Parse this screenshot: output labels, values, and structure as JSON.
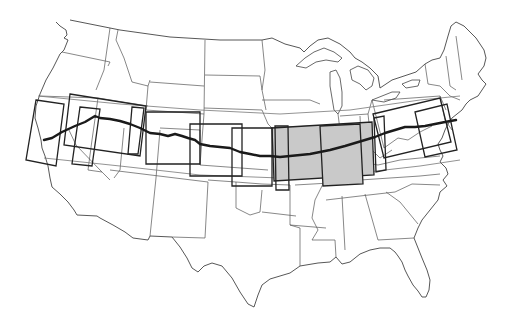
{
  "map": {
    "subject": "Contiguous United States outline map with a cross-country route and overlapping map-sheet index boxes",
    "colors": {
      "background": "#ffffff",
      "state_lines": "#555555",
      "route": "#1a1a1a",
      "box_stroke": "#222222",
      "highlight_fill": "#c9c9c9"
    },
    "route": {
      "label": "Cross-country route (west coast to east coast)",
      "points": [
        [
          44,
          140
        ],
        [
          62,
          132
        ],
        [
          85,
          122
        ],
        [
          100,
          118
        ],
        [
          115,
          120
        ],
        [
          130,
          124
        ],
        [
          140,
          128
        ],
        [
          150,
          133
        ],
        [
          165,
          136
        ],
        [
          180,
          136
        ],
        [
          195,
          140
        ],
        [
          210,
          146
        ],
        [
          225,
          147
        ],
        [
          240,
          152
        ],
        [
          255,
          155
        ],
        [
          270,
          156
        ],
        [
          290,
          156
        ],
        [
          310,
          154
        ],
        [
          330,
          150
        ],
        [
          355,
          143
        ],
        [
          375,
          137
        ],
        [
          395,
          130
        ],
        [
          410,
          127
        ],
        [
          420,
          126
        ],
        [
          430,
          125
        ],
        [
          445,
          120
        ],
        [
          456,
          120
        ]
      ]
    },
    "index_boxes": [
      {
        "id": "box-1",
        "x": 32,
        "y": 100,
        "w": 28,
        "h": 55,
        "rot": 5,
        "highlighted": false
      },
      {
        "id": "box-2",
        "x": 64,
        "y": 98,
        "w": 40,
        "h": 48,
        "rot": 5,
        "highlighted": false
      },
      {
        "id": "box-3",
        "x": 98,
        "y": 95,
        "w": 40,
        "h": 60,
        "rot": 4,
        "highlighted": false
      },
      {
        "id": "box-4",
        "x": 135,
        "y": 106,
        "w": 42,
        "h": 52,
        "rot": 3,
        "highlighted": false
      },
      {
        "id": "box-5",
        "x": 190,
        "y": 122,
        "w": 52,
        "h": 38,
        "rot": 0,
        "highlighted": false
      },
      {
        "id": "box-6",
        "x": 230,
        "y": 127,
        "w": 42,
        "h": 60,
        "rot": 0,
        "highlighted": false
      },
      {
        "id": "box-7",
        "x": 272,
        "y": 124,
        "w": 100,
        "h": 52,
        "rot": -3,
        "highlighted": true
      },
      {
        "id": "box-8",
        "x": 320,
        "y": 122,
        "w": 46,
        "h": 63,
        "rot": -3,
        "highlighted": true
      },
      {
        "id": "box-9",
        "x": 372,
        "y": 110,
        "w": 72,
        "h": 46,
        "rot": -8,
        "highlighted": false
      },
      {
        "id": "box-10",
        "x": 418,
        "y": 100,
        "w": 26,
        "h": 58,
        "rot": -8,
        "highlighted": false
      }
    ],
    "labels": []
  }
}
